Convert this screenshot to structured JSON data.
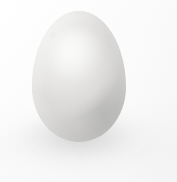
{
  "scene": {
    "title": "Egg",
    "subject": "chicken-egg",
    "description": "A single pale grey-white egg centered on a plain white background with a soft diffuse shadow beneath it.",
    "orientation": "upright, narrow end up",
    "count": 1
  },
  "background": {
    "name": "plain-white-backdrop",
    "color": "#ffffff",
    "secondary_color": "#f8f8f8"
  },
  "egg": {
    "name": "egg",
    "body_color": "#e4e3e1",
    "highlight_color": "#f2f1ef",
    "shadow_color": "#cbcac8",
    "rim_color": "#bcbcba",
    "bounds": {
      "left": 32,
      "top": 11,
      "width": 94,
      "height": 131
    }
  },
  "shadow": {
    "name": "ground-shadow",
    "color": "#a8a8a8",
    "opacity": "0.40"
  },
  "canvas": {
    "width": 177,
    "height": 182
  }
}
